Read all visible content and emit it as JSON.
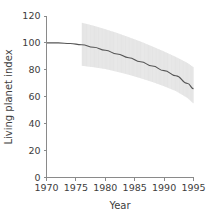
{
  "chart_data": {
    "type": "line",
    "title": "",
    "subtitle": "",
    "xlabel": "Year",
    "ylabel": "Living planet index",
    "xlim": [
      1970,
      1995
    ],
    "ylim": [
      0,
      120
    ],
    "grid": false,
    "legend": null,
    "x_ticks": [
      "1970",
      "1975",
      "1980",
      "1985",
      "1990",
      "1995"
    ],
    "x_tick_values": [
      1970,
      1975,
      1980,
      1985,
      1990,
      1995
    ],
    "y_ticks": [
      "0",
      "20",
      "40",
      "60",
      "80",
      "100",
      "120"
    ],
    "y_tick_values": [
      0,
      20,
      40,
      60,
      80,
      100,
      120
    ],
    "x": [
      1970,
      1972,
      1974,
      1976,
      1978,
      1980,
      1982,
      1984,
      1986,
      1988,
      1990,
      1992,
      1994,
      1995
    ],
    "series": [
      {
        "name": "Living planet index",
        "values": [
          100.0,
          100.0,
          99.6,
          98.6,
          96.8,
          94.5,
          91.8,
          89.0,
          86.0,
          82.8,
          79.4,
          75.6,
          69.8,
          66.0
        ],
        "color": "#555555"
      }
    ],
    "band": {
      "name": "confidence band",
      "x": [
        1976,
        1978,
        1980,
        1982,
        1984,
        1986,
        1988,
        1990,
        1992,
        1994,
        1995
      ],
      "upper": [
        115.0,
        112.8,
        110.2,
        107.4,
        104.3,
        101.0,
        97.4,
        93.6,
        89.6,
        85.0,
        82.0
      ],
      "lower": [
        83.0,
        82.0,
        80.6,
        78.6,
        76.4,
        73.8,
        71.0,
        67.8,
        64.2,
        59.0,
        55.0
      ],
      "fill_color": "#ededed",
      "hatch_color": "#dadada"
    },
    "axis_color": "#8a8a8a",
    "text_color": "#3d3d3d",
    "background_color": "#ffffff"
  },
  "axis": {
    "x_title": "Year",
    "y_title": "Living planet index"
  }
}
